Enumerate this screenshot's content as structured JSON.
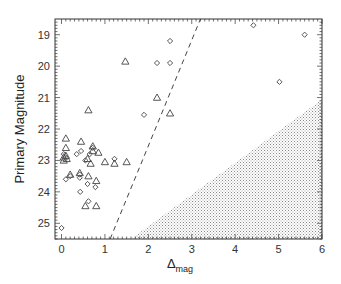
{
  "chart_data": {
    "type": "scatter",
    "title": "",
    "xlabel": "Δ_mag",
    "xlabel_main": "Δ",
    "xlabel_sub": "mag",
    "ylabel": "Primary Magnitude",
    "xlim": [
      -0.15,
      6.0
    ],
    "ylim": [
      25.5,
      18.5
    ],
    "y_inverted": true,
    "x_ticks": [
      0,
      1,
      2,
      3,
      4,
      5,
      6
    ],
    "x_tick_labels": [
      "0",
      "1",
      "2",
      "3",
      "4",
      "5",
      "6"
    ],
    "y_ticks": [
      19,
      20,
      21,
      22,
      23,
      24,
      25
    ],
    "y_tick_labels": [
      "19",
      "20",
      "21",
      "22",
      "23",
      "24",
      "25"
    ],
    "grid": false,
    "legend": null,
    "series": [
      {
        "name": "diamonds",
        "marker": "diamond",
        "points": [
          [
            4.42,
            18.7
          ],
          [
            5.6,
            19.0
          ],
          [
            5.02,
            20.5
          ],
          [
            2.5,
            19.2
          ],
          [
            2.2,
            19.9
          ],
          [
            2.5,
            19.9
          ],
          [
            1.9,
            21.55
          ],
          [
            0.0,
            25.15
          ],
          [
            0.05,
            22.8
          ],
          [
            0.35,
            22.8
          ],
          [
            0.65,
            22.8
          ],
          [
            0.55,
            23.0
          ],
          [
            0.2,
            23.5
          ],
          [
            0.1,
            23.6
          ],
          [
            0.42,
            23.55
          ],
          [
            0.42,
            23.45
          ],
          [
            0.6,
            23.75
          ],
          [
            0.78,
            23.85
          ],
          [
            0.43,
            24.0
          ],
          [
            0.62,
            24.3
          ],
          [
            0.72,
            22.6
          ],
          [
            1.22,
            22.95
          ],
          [
            0.45,
            22.7
          ]
        ]
      },
      {
        "name": "triangles",
        "marker": "triangle",
        "points": [
          [
            1.47,
            19.85
          ],
          [
            2.2,
            21.0
          ],
          [
            2.5,
            21.5
          ],
          [
            0.62,
            21.4
          ],
          [
            0.1,
            22.3
          ],
          [
            0.45,
            22.4
          ],
          [
            0.1,
            22.6
          ],
          [
            0.72,
            22.55
          ],
          [
            0.72,
            22.7
          ],
          [
            0.85,
            22.75
          ],
          [
            0.1,
            22.85
          ],
          [
            0.12,
            22.95
          ],
          [
            0.05,
            23.0
          ],
          [
            0.6,
            22.95
          ],
          [
            0.67,
            23.1
          ],
          [
            1.0,
            23.05
          ],
          [
            1.22,
            23.1
          ],
          [
            1.5,
            23.05
          ],
          [
            0.2,
            23.45
          ],
          [
            0.42,
            23.4
          ],
          [
            0.62,
            23.5
          ],
          [
            0.8,
            23.65
          ],
          [
            0.55,
            24.45
          ],
          [
            0.8,
            24.45
          ],
          [
            0.05,
            22.9
          ]
        ]
      }
    ],
    "annotations": {
      "dashed_line": {
        "from": [
          1.12,
          25.5
        ],
        "to": [
          3.2,
          18.5
        ]
      },
      "shaded_region": {
        "vertices": [
          [
            1.6,
            25.5
          ],
          [
            6.0,
            21.05
          ],
          [
            6.0,
            25.5
          ]
        ],
        "pattern": "stipple"
      }
    }
  },
  "colors": {
    "frame": "#333333",
    "marker": "#444444",
    "shade_dots": "#888888",
    "text": "#333333"
  }
}
